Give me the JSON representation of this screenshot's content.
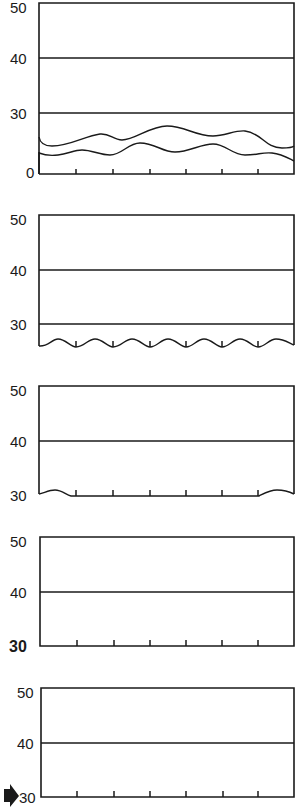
{
  "figure": {
    "colors": {
      "ink": "#1a1a1a",
      "background": "#ffffff"
    }
  },
  "panels": [
    {
      "id": 1,
      "labels": {
        "top": "50",
        "mid": "40",
        "low": "30",
        "bottom": "0"
      },
      "bottom_label_style": "normal",
      "gridlines": [
        "40",
        "30"
      ],
      "features": "two wavy lines (surface layers) between 0 and 30",
      "ticks": 6
    },
    {
      "id": 2,
      "labels": {
        "top": "50",
        "mid": "40",
        "low": "30"
      },
      "bottom_label_style": "none",
      "gridlines": [
        "40",
        "30"
      ],
      "features": "regular small wave along bottom edge",
      "ticks": 6
    },
    {
      "id": 3,
      "labels": {
        "top": "50",
        "mid": "40",
        "bottom": "30"
      },
      "bottom_label_style": "normal",
      "gridlines": [
        "40"
      ],
      "features": "small bumps at left and right ends of bottom edge",
      "ticks": 6
    },
    {
      "id": 4,
      "labels": {
        "top": "50",
        "mid": "40",
        "bottom": "30"
      },
      "bottom_label_style": "bold",
      "gridlines": [
        "40"
      ],
      "features": "flat bottom edge",
      "ticks": 6
    },
    {
      "id": 5,
      "labels": {
        "top": "50",
        "mid": "40",
        "bottom": "30"
      },
      "bottom_label_style": "arrow-marked",
      "gridlines": [
        "40"
      ],
      "features": "flat bottom edge with pointer arrow at 30",
      "ticks": 6,
      "marker": "right-pointing-arrow"
    }
  ]
}
